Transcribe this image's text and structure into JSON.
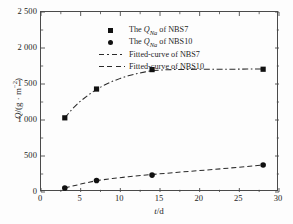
{
  "chart_data": {
    "type": "scatter",
    "title": "",
    "xlabel": "t/d",
    "ylabel": "Q/(g·m⁻²)",
    "xlim": [
      0,
      30
    ],
    "ylim": [
      0,
      2500
    ],
    "xticks": [
      0,
      5,
      10,
      15,
      20,
      25,
      30
    ],
    "yticks": [
      0,
      500,
      1000,
      1500,
      2000,
      2500
    ],
    "xtick_labels": [
      "0",
      "5",
      "10",
      "15",
      "20",
      "25",
      "30"
    ],
    "ytick_labels": [
      "0",
      "500",
      "1 000",
      "1 500",
      "2 000",
      "2 500"
    ],
    "grid": false,
    "legend_position": "upper-left-inside",
    "series": [
      {
        "name": "The Q_Na of NBS7",
        "marker": "square",
        "x": [
          3,
          7,
          14,
          28
        ],
        "values": [
          1030,
          1430,
          1700,
          1705
        ]
      },
      {
        "name": "The Q_Na of NBS10",
        "marker": "circle",
        "x": [
          3,
          7,
          14,
          28
        ],
        "values": [
          55,
          160,
          235,
          375
        ]
      },
      {
        "name": "Fitted-curve of NBS7",
        "marker": "none",
        "linestyle": "dash-dot",
        "x": [
          3,
          4,
          5,
          6,
          7,
          8,
          9,
          10,
          11,
          12,
          13,
          14,
          16,
          18,
          20,
          22,
          24,
          26,
          28
        ],
        "values": [
          1030,
          1160,
          1265,
          1350,
          1425,
          1486,
          1537,
          1578,
          1613,
          1641,
          1665,
          1686,
          1699,
          1702,
          1704,
          1705,
          1706,
          1707,
          1708
        ]
      },
      {
        "name": "Fitted-curve of NBS10",
        "marker": "none",
        "linestyle": "dashed",
        "x": [
          3,
          5,
          7,
          9,
          11,
          14,
          17,
          20,
          23,
          26,
          28
        ],
        "values": [
          55,
          110,
          158,
          188,
          212,
          243,
          272,
          298,
          325,
          355,
          375
        ]
      }
    ]
  },
  "legend": {
    "entries": [
      {
        "key": "square-marker",
        "prefix": "The ",
        "symbol": "Q",
        "subscript": "Na",
        "suffix": " of NBS7"
      },
      {
        "key": "circle-marker",
        "prefix": "The ",
        "symbol": "Q",
        "subscript": "Na",
        "suffix": " of NBS10"
      },
      {
        "key": "dashdot-line",
        "label": "Fitted-curve of NBS7"
      },
      {
        "key": "dashed-line",
        "label": "Fitted-curve of NBS10"
      }
    ]
  },
  "axes": {
    "x_title_symbol": "t",
    "x_title_rest": "/d",
    "y_title_symbol": "Q",
    "y_title_open": "/(g · m",
    "y_title_exp": "−2",
    "y_title_close": ")"
  },
  "colors": {
    "ink": "#1a1a1a",
    "frame": "#4a4a4a",
    "marker": "#111111",
    "background": "#fdfdfd"
  }
}
